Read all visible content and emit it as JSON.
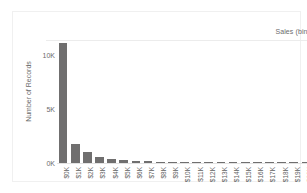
{
  "window": {
    "clipped_top_text": ""
  },
  "chart_data": {
    "type": "bar",
    "title": "",
    "column_header": "Sales (bin)",
    "xlabel": "Sales (bin)",
    "ylabel": "Number of Records",
    "grid": false,
    "legend": null,
    "ylim": [
      0,
      11500
    ],
    "yticks": [
      0,
      5000,
      10000
    ],
    "ytick_labels": [
      "0K",
      "5K",
      "10K"
    ],
    "categories": [
      "$0K",
      "$1K",
      "$2K",
      "$3K",
      "$4K",
      "$5K",
      "$6K",
      "$7K",
      "$8K",
      "$9K",
      "$10K",
      "$11K",
      "$12K",
      "$13K",
      "$14K",
      "$15K",
      "$16K",
      "$17K",
      "$18K",
      "$19K",
      "$20K"
    ],
    "values": [
      11200,
      1800,
      1000,
      550,
      330,
      250,
      210,
      150,
      120,
      100,
      75,
      70,
      65,
      60,
      55,
      50,
      45,
      12,
      8,
      6,
      4
    ],
    "bar_color": "#706f6f",
    "axis_text_color": "#6b6b6b",
    "background_color": "#ffffff"
  }
}
